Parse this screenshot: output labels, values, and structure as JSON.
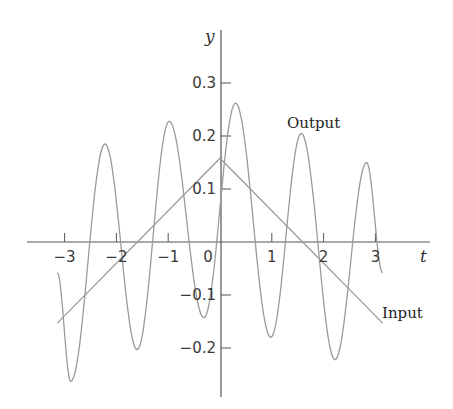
{
  "chart_data": {
    "type": "line",
    "title": "",
    "xlabel": "t",
    "ylabel": "y",
    "xlim": [
      -3.7,
      4.1
    ],
    "ylim": [
      -0.29,
      0.4
    ],
    "grid": false,
    "legend": "inline labels",
    "x_ticks": [
      -3,
      -2,
      -1,
      0,
      1,
      2,
      3
    ],
    "x_tick_labels": [
      "−3",
      "−2",
      "−1",
      "0",
      "1",
      "2",
      "3"
    ],
    "y_ticks": [
      0.3,
      0.2,
      0.1,
      -0.1,
      -0.2
    ],
    "y_tick_labels": [
      "0.3",
      "0.2",
      "0.1",
      "−0.1",
      "−0.2"
    ],
    "series": [
      {
        "name": "Input",
        "label": "Input",
        "shape": "triangle",
        "points": [
          [
            -3.14,
            -0.153
          ],
          [
            0.0,
            0.158
          ],
          [
            3.14,
            -0.153
          ]
        ]
      },
      {
        "name": "Output",
        "label": "Output",
        "shape": "oscillating (cosine half-waves between extrema)",
        "extrema": [
          [
            -3.14,
            -0.058
          ],
          [
            -2.88,
            -0.263
          ],
          [
            -2.22,
            0.185
          ],
          [
            -1.6,
            -0.203
          ],
          [
            -0.98,
            0.228
          ],
          [
            -0.31,
            -0.143
          ],
          [
            0.3,
            0.262
          ],
          [
            0.98,
            -0.18
          ],
          [
            1.57,
            0.205
          ],
          [
            2.22,
            -0.222
          ],
          [
            2.83,
            0.15
          ],
          [
            3.14,
            -0.058
          ]
        ]
      }
    ],
    "annotations": [
      {
        "text": "Output",
        "t": 1.55,
        "y": 0.24
      },
      {
        "text": "Input",
        "t": 3.7,
        "y": -0.125
      }
    ]
  },
  "labels": {
    "x_axis": "t",
    "y_axis": "y",
    "output": "Output",
    "input": "Input"
  },
  "colors": {
    "axis": "#555555",
    "curve": "#9a9a9a",
    "text": "#333333"
  }
}
